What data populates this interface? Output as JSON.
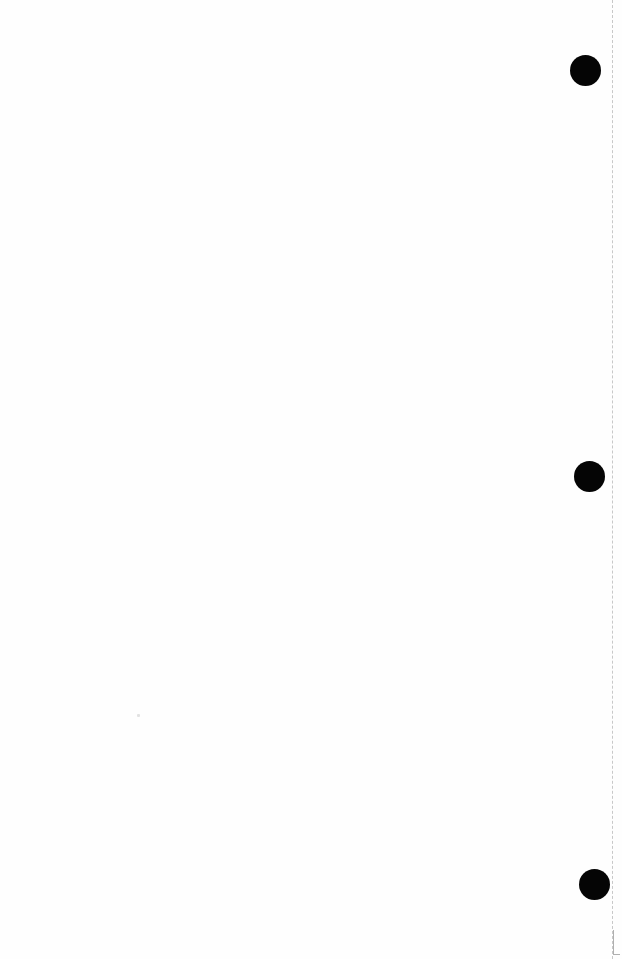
{
  "page": {
    "type": "blank scanned page",
    "background": "#fefefe",
    "text": ""
  },
  "punch_holes": [
    {
      "cx": 585,
      "cy": 70,
      "diameter": 31,
      "color": "#050505"
    },
    {
      "cx": 589,
      "cy": 476,
      "diameter": 31,
      "color": "#050505"
    },
    {
      "cx": 594,
      "cy": 884,
      "diameter": 31,
      "color": "#050505"
    }
  ],
  "edge_line": {
    "x": 612,
    "style": "dashed",
    "color": "#c8c8c8"
  }
}
